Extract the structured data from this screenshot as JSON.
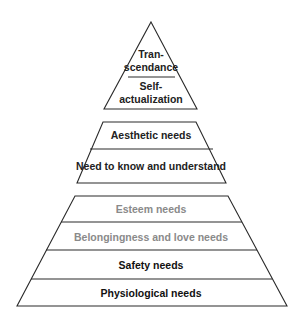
{
  "diagram": {
    "colors": {
      "fill_center": "#dcdcdc",
      "fill_edge": "#8e8e8e",
      "outline": "#2a2a2a",
      "text_dark": "#222222",
      "text_light": "#8a8a8a"
    },
    "groups": [
      {
        "name": "transcendence-group",
        "levels": [
          {
            "line1": "Tran-",
            "line2": "scendance",
            "text_color": "dark"
          },
          {
            "line1": "Self-",
            "line2": "actualization",
            "text_color": "dark"
          }
        ]
      },
      {
        "name": "growth-group",
        "levels": [
          {
            "label": "Aesthetic needs",
            "text_color": "dark"
          },
          {
            "label": "Need to know and understand",
            "text_color": "dark"
          }
        ]
      },
      {
        "name": "deficiency-group",
        "levels": [
          {
            "label": "Esteem needs",
            "text_color": "light"
          },
          {
            "label": "Belongingness and love needs",
            "text_color": "light"
          },
          {
            "label": "Safety needs",
            "text_color": "dark"
          },
          {
            "label": "Physiological needs",
            "text_color": "dark"
          }
        ]
      }
    ]
  }
}
